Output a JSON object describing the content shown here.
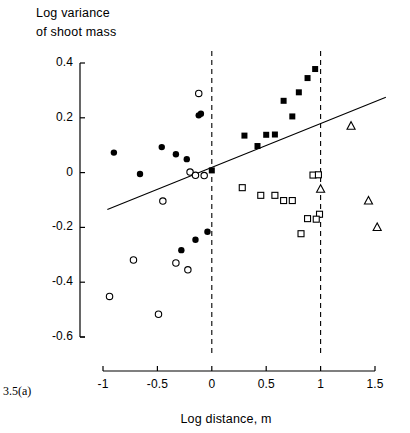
{
  "figure": {
    "number_label": "3.5(a)",
    "y_axis_title_line1": "Log variance",
    "y_axis_title_line2": "of shoot mass",
    "x_axis_title": "Log distance, m"
  },
  "chart_data": {
    "type": "scatter",
    "title": "",
    "subtitle": "",
    "xlabel": "Log distance, m",
    "ylabel": "Log variance of shoot mass",
    "xlim": [
      -1.15,
      1.62
    ],
    "ylim": [
      -0.6,
      0.42
    ],
    "xticks": [
      -1,
      -0.5,
      0,
      0.5,
      1,
      1.5
    ],
    "xtick_labels": [
      "-1",
      "-0.5",
      "0",
      "0.5",
      "1",
      "1.5"
    ],
    "yticks": [
      0.4,
      0.2,
      0,
      -0.2,
      -0.4,
      -0.6
    ],
    "ytick_labels": [
      "0.4",
      "0.2",
      "0",
      "-0.2",
      "-0.4",
      "-0.6"
    ],
    "grid": false,
    "legend": false,
    "legend_position": "none",
    "annotations": [
      {
        "name": "vertical-dashed-line-at-0",
        "type": "vline",
        "x": 0,
        "style": "dashed"
      },
      {
        "name": "vertical-dashed-line-at-1",
        "type": "vline",
        "x": 1,
        "style": "dashed"
      }
    ],
    "trendline": {
      "name": "regression-line",
      "type": "line",
      "x_start": -0.96,
      "y_start": -0.135,
      "x_end": 1.6,
      "y_end": 0.275,
      "style": "solid"
    },
    "series": [
      {
        "name": "filled-circle",
        "marker": "filled-circle",
        "color": "#000000",
        "points": [
          {
            "x": -0.9,
            "y": 0.073
          },
          {
            "x": -0.66,
            "y": -0.005
          },
          {
            "x": -0.46,
            "y": 0.093
          },
          {
            "x": -0.33,
            "y": 0.067
          },
          {
            "x": -0.23,
            "y": 0.049
          },
          {
            "x": -0.12,
            "y": 0.209
          },
          {
            "x": -0.15,
            "y": -0.245
          },
          {
            "x": -0.04,
            "y": -0.216
          },
          {
            "x": -0.28,
            "y": -0.283
          },
          {
            "x": -0.1,
            "y": 0.215
          }
        ]
      },
      {
        "name": "open-circle",
        "marker": "open-circle",
        "color": "#000000",
        "points": [
          {
            "x": -0.94,
            "y": -0.452
          },
          {
            "x": -0.72,
            "y": -0.319
          },
          {
            "x": -0.45,
            "y": -0.104
          },
          {
            "x": -0.2,
            "y": 0.002
          },
          {
            "x": -0.15,
            "y": -0.01
          },
          {
            "x": -0.07,
            "y": -0.011
          },
          {
            "x": -0.12,
            "y": 0.289
          },
          {
            "x": -0.49,
            "y": -0.517
          },
          {
            "x": -0.22,
            "y": -0.355
          },
          {
            "x": -0.33,
            "y": -0.33
          }
        ]
      },
      {
        "name": "filled-square",
        "marker": "filled-square",
        "color": "#000000",
        "points": [
          {
            "x": 0.0,
            "y": 0.008
          },
          {
            "x": 0.3,
            "y": 0.135
          },
          {
            "x": 0.42,
            "y": 0.097
          },
          {
            "x": 0.5,
            "y": 0.138
          },
          {
            "x": 0.58,
            "y": 0.139
          },
          {
            "x": 0.66,
            "y": 0.262
          },
          {
            "x": 0.74,
            "y": 0.205
          },
          {
            "x": 0.8,
            "y": 0.293
          },
          {
            "x": 0.88,
            "y": 0.345
          },
          {
            "x": 0.95,
            "y": 0.378
          }
        ]
      },
      {
        "name": "open-square",
        "marker": "open-square",
        "color": "#000000",
        "points": [
          {
            "x": 0.28,
            "y": -0.055
          },
          {
            "x": 0.45,
            "y": -0.083
          },
          {
            "x": 0.58,
            "y": -0.083
          },
          {
            "x": 0.66,
            "y": -0.102
          },
          {
            "x": 0.74,
            "y": -0.102
          },
          {
            "x": 0.93,
            "y": -0.009
          },
          {
            "x": 0.98,
            "y": -0.008
          },
          {
            "x": 0.99,
            "y": -0.152
          },
          {
            "x": 0.88,
            "y": -0.168
          },
          {
            "x": 0.96,
            "y": -0.17
          },
          {
            "x": 0.82,
            "y": -0.223
          }
        ]
      },
      {
        "name": "open-triangle",
        "marker": "open-triangle",
        "color": "#000000",
        "points": [
          {
            "x": 1.28,
            "y": 0.17
          },
          {
            "x": 1.0,
            "y": -0.06
          },
          {
            "x": 1.44,
            "y": -0.103
          },
          {
            "x": 1.52,
            "y": -0.2
          }
        ]
      }
    ]
  }
}
